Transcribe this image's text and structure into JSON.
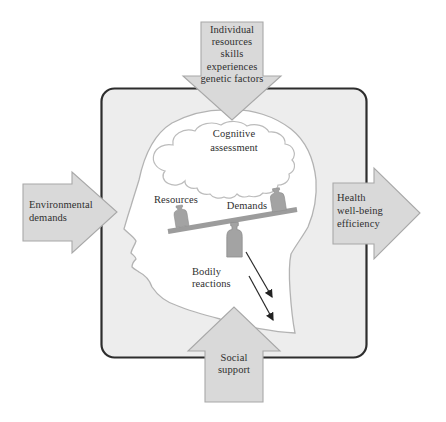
{
  "colors": {
    "arrow_fill": "#d9d9d9",
    "arrow_stroke": "#a8a8a8",
    "box_fill": "#ededed",
    "box_stroke": "#2d2d2d",
    "head_stroke": "#b3b3b3",
    "brain_stroke": "#bcbcbc",
    "beam_gray": "#9c9c9c",
    "weight_gray": "#a3a3a3",
    "ink": "#2f2f2f"
  },
  "arrows": {
    "top": {
      "direction": "down",
      "lines": [
        "Individual",
        "resources",
        "skills",
        "experiences",
        "genetic factors"
      ]
    },
    "left": {
      "direction": "right",
      "lines": [
        "Environmental",
        "demands"
      ]
    },
    "right": {
      "direction": "right",
      "lines": [
        "Health",
        "well-being",
        "efficiency"
      ]
    },
    "bottom": {
      "direction": "up",
      "lines": [
        "Social",
        "support"
      ]
    }
  },
  "labels": {
    "cognitive": {
      "line1": "Cognitive",
      "line2": "assessment"
    },
    "resources": "Resources",
    "demands": "Demands",
    "bodily": {
      "line1": "Bodily",
      "line2": "reactions"
    }
  }
}
